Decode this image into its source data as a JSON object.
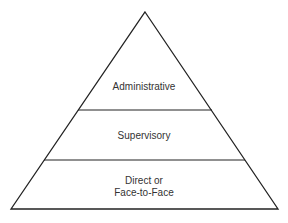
{
  "diagram": {
    "type": "pyramid",
    "levels": [
      {
        "label": "Administrative"
      },
      {
        "label": "Supervisory"
      },
      {
        "label_line1": "Direct or",
        "label_line2": "Face-to-Face"
      }
    ],
    "colors": {
      "stroke": "#222222",
      "text": "#333333",
      "background": "#ffffff"
    }
  }
}
